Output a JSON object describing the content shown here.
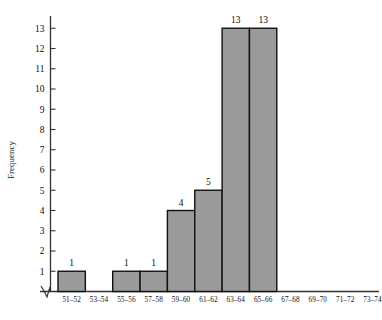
{
  "chart_data": {
    "type": "bar",
    "title": "",
    "subtitle": "",
    "xlabel": "",
    "ylabel": "Frequency",
    "categories": [
      "51-52",
      "53-54",
      "55-56",
      "57-58",
      "59-60",
      "61-62",
      "63-64",
      "65-66",
      "67-68",
      "69-70",
      "71-72",
      "73-74"
    ],
    "values": [
      1,
      0,
      1,
      1,
      4,
      5,
      13,
      13,
      0,
      0,
      0,
      0
    ],
    "bar_labels": [
      "1",
      "",
      "1",
      "1",
      "4",
      "5",
      "13",
      "13",
      "",
      "",
      "",
      ""
    ],
    "ylim": [
      0,
      13
    ],
    "yticks": [
      1,
      2,
      3,
      4,
      5,
      6,
      7,
      8,
      9,
      10,
      11,
      12,
      13
    ],
    "ytick_labels": [
      "1",
      "2",
      "3",
      "4",
      "5",
      "6",
      "7",
      "8",
      "9",
      "10",
      "11",
      "12",
      "13"
    ],
    "grid": false,
    "legend": null,
    "axis_break": "zigzag-at-origin",
    "bar_fill_color": "#9a9a9a",
    "bar_edge_color": "#111111",
    "axis_color": "#333333",
    "text_color": "#0d0d0d"
  }
}
